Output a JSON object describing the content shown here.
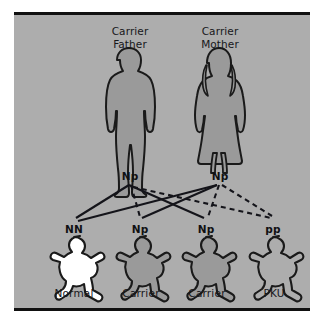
{
  "diagram": {
    "panel_color": "#adadad",
    "outline_color": "#1a1a1a",
    "rule_color": "#111111",
    "parents": [
      {
        "id": "father",
        "caption": "Carrier\nFather",
        "genotype": "Np",
        "figure": "male-silhouette",
        "fill": "#9a9a9a"
      },
      {
        "id": "mother",
        "caption": "Carrier\nMother",
        "genotype": "Np",
        "figure": "female-silhouette",
        "fill": "#9a9a9a"
      }
    ],
    "children": [
      {
        "id": "child-normal",
        "genotype": "NN",
        "phenotype": "Normal",
        "figure": "baby-silhouette",
        "fill": "#ffffff"
      },
      {
        "id": "child-carrier-1",
        "genotype": "Np",
        "phenotype": "Carrier",
        "figure": "baby-silhouette",
        "fill": "#9a9a9a"
      },
      {
        "id": "child-carrier-2",
        "genotype": "Np",
        "phenotype": "Carrier",
        "figure": "baby-silhouette",
        "fill": "#9a9a9a"
      },
      {
        "id": "child-pku",
        "genotype": "pp",
        "phenotype": "PKU",
        "figure": "baby-silhouette",
        "fill": "none"
      }
    ],
    "allele_lines": {
      "solid_meaning": "N allele (normal)",
      "dashed_meaning": "p allele (PKU)",
      "line_color": "#14141a"
    }
  }
}
